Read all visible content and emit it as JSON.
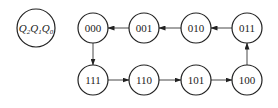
{
  "legend": {
    "label_html": [
      "Q",
      "2",
      "Q",
      "1",
      "Q",
      "0"
    ],
    "text": "Q2Q1Q0"
  },
  "states": [
    {
      "id": "000",
      "label": "000",
      "x": 93,
      "y": 28
    },
    {
      "id": "001",
      "label": "001",
      "x": 144,
      "y": 28
    },
    {
      "id": "010",
      "label": "010",
      "x": 196,
      "y": 28
    },
    {
      "id": "011",
      "label": "011",
      "x": 247,
      "y": 28
    },
    {
      "id": "111",
      "label": "111",
      "x": 93,
      "y": 80
    },
    {
      "id": "110",
      "label": "110",
      "x": 144,
      "y": 80
    },
    {
      "id": "101",
      "label": "101",
      "x": 196,
      "y": 80
    },
    {
      "id": "100",
      "label": "100",
      "x": 247,
      "y": 80
    }
  ],
  "transitions": [
    {
      "from": "000",
      "to": "111"
    },
    {
      "from": "111",
      "to": "110"
    },
    {
      "from": "110",
      "to": "101"
    },
    {
      "from": "101",
      "to": "100"
    },
    {
      "from": "100",
      "to": "011"
    },
    {
      "from": "011",
      "to": "010"
    },
    {
      "from": "010",
      "to": "001"
    },
    {
      "from": "001",
      "to": "000"
    }
  ],
  "colors": {
    "stroke": "#222222",
    "background": "#ffffff"
  }
}
